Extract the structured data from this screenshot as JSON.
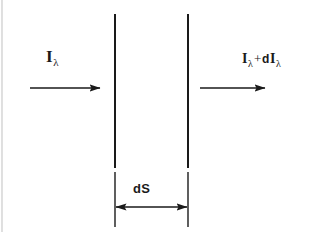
{
  "figure": {
    "background_color": "#ffffff",
    "ink_color": "#1a1a1a",
    "width": 314,
    "height": 232
  },
  "labels": {
    "incident": {
      "symbol": "I",
      "subscript": "λ",
      "full_text": "Iλ",
      "meaning": "incident specific intensity"
    },
    "emergent": {
      "symbol": "I",
      "subscript": "λ",
      "operator": "+",
      "differential": "d",
      "symbol2": "I",
      "subscript2": "λ",
      "full_text": "Iλ + dIλ",
      "meaning": "emergent specific intensity"
    },
    "thickness": {
      "text": "dS",
      "meaning": "slab thickness element"
    }
  },
  "geometry": {
    "slab": {
      "left_boundary_x": 115,
      "right_boundary_x": 188,
      "top_y": 14,
      "bottom_y": 168,
      "extension_top_y": 172,
      "extension_bottom_y": 227
    },
    "incident_arrow": {
      "x1": 30,
      "y1": 88,
      "x2": 101,
      "y2": 88,
      "direction": "right"
    },
    "emergent_arrow": {
      "x1": 200,
      "y1": 88,
      "x2": 266,
      "y2": 88,
      "direction": "right"
    },
    "dimension_arrow": {
      "x1": 115,
      "y1": 207,
      "x2": 188,
      "y2": 207,
      "direction": "both"
    },
    "edge_artifact": {
      "x": 2,
      "y1": 0,
      "y2": 232
    }
  }
}
